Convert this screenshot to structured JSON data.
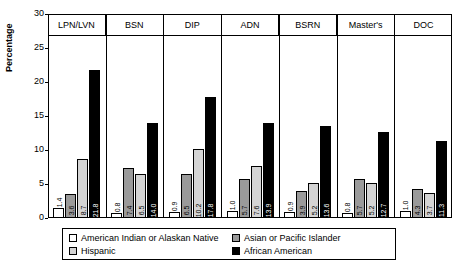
{
  "chart_data": {
    "type": "bar",
    "title": "",
    "xlabel": "",
    "ylabel": "Percentage",
    "ylim": [
      0,
      30
    ],
    "yticks": [
      0,
      5,
      10,
      15,
      20,
      25,
      30
    ],
    "grid": false,
    "legend_position": "bottom",
    "categories": [
      "LPN/LVN",
      "BSN",
      "DIP",
      "ADN",
      "BSRN",
      "Master's",
      "DOC"
    ],
    "series": [
      {
        "name": "American Indian or Alaskan Native",
        "color": "#ffffff",
        "values": [
          1.4,
          0.8,
          0.9,
          1.0,
          0.9,
          0.8,
          1.0
        ]
      },
      {
        "name": "Asian or Pacific Islander",
        "color": "#9a9a9a",
        "values": [
          3.6,
          7.4,
          6.5,
          5.7,
          3.9,
          5.7,
          4.3
        ]
      },
      {
        "name": "Hispanic",
        "color": "#d4d4d4",
        "values": [
          8.7,
          6.5,
          10.2,
          7.6,
          5.2,
          5.2,
          3.7
        ]
      },
      {
        "name": "African American",
        "color": "#000000",
        "values": [
          21.8,
          14.0,
          17.8,
          13.9,
          13.6,
          12.7,
          11.3
        ]
      }
    ]
  }
}
